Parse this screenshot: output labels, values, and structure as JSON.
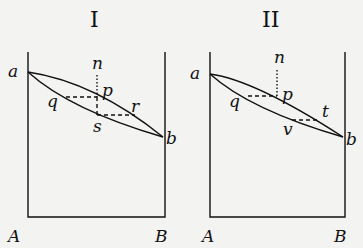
{
  "figures": [
    {
      "title": "I",
      "points": {
        "a": "a",
        "b": "b",
        "p": "p",
        "q": "q",
        "n": "n",
        "s": "s",
        "r": "r"
      },
      "base": {
        "left": "A",
        "right": "B"
      }
    },
    {
      "title": "II",
      "points": {
        "a": "a",
        "b": "b",
        "p": "p",
        "q": "q",
        "n": "n",
        "v": "v",
        "t": "t"
      },
      "base": {
        "left": "A",
        "right": "B"
      }
    }
  ],
  "colors": {
    "ink": "#111111",
    "background": "#f3f3f1"
  }
}
